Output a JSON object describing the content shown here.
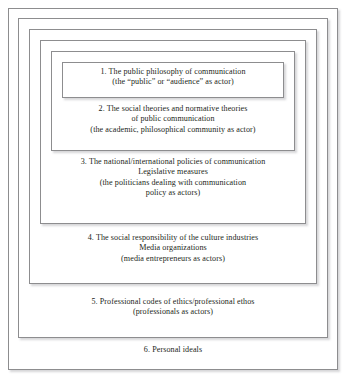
{
  "diagram": {
    "type": "nested-boxes",
    "colors": {
      "background": "#ffffff",
      "border": "#8d8d8f",
      "text": "#231f20",
      "shadow": "rgba(120,120,125,0.30)"
    },
    "levels": [
      {
        "number": "1",
        "nesting": "innermost",
        "lines": [
          "1. The public philosophy of communication",
          "(the “public” or “audience” as actor)"
        ]
      },
      {
        "number": "2",
        "nesting": "2nd",
        "lines": [
          "2. The social theories and normative theories",
          "of public communication",
          "(the academic, philosophical community as actor)"
        ]
      },
      {
        "number": "3",
        "nesting": "3rd",
        "lines": [
          "3. The national/international policies of communication",
          "Legislative measures",
          "(the politicians dealing with communication",
          "policy as actors)"
        ]
      },
      {
        "number": "4",
        "nesting": "4th",
        "lines": [
          "4. The social responsibility of the culture industries",
          "Media organizations",
          "(media entrepreneurs as actors)"
        ]
      },
      {
        "number": "5",
        "nesting": "5th",
        "lines": [
          "5. Professional codes of ethics/professional ethos",
          "(professionals as actors)"
        ]
      },
      {
        "number": "6",
        "nesting": "outermost",
        "lines": [
          "6. Personal ideals"
        ]
      }
    ]
  }
}
